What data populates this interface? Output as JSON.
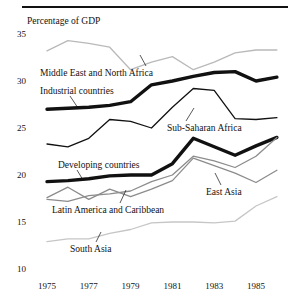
{
  "chart_data": {
    "type": "line",
    "title": "Percentage of GDP",
    "xlabel": "",
    "ylabel": "Percentage of GDP",
    "xlim": [
      1975,
      1986
    ],
    "ylim": [
      10,
      35
    ],
    "yticks": [
      35,
      30,
      25,
      20,
      15,
      10
    ],
    "xticks": [
      1975,
      1977,
      1979,
      1981,
      1983,
      1985
    ],
    "x": [
      1975,
      1976,
      1977,
      1978,
      1979,
      1980,
      1981,
      1982,
      1983,
      1984,
      1985,
      1986
    ],
    "grid": false,
    "legend": "inline-labels",
    "series": [
      {
        "name": "Middle East and North Africa",
        "color": "#b9b9b9",
        "width": 1.3,
        "label_x": 40,
        "label_y": 68,
        "leader": {
          "x1": 146,
          "y1": 66,
          "x2": 140,
          "y2": 55
        },
        "values": [
          33.2,
          34.3,
          34.0,
          33.6,
          31.2,
          32.0,
          32.6,
          31.2,
          32.0,
          33.0,
          33.3,
          33.3
        ]
      },
      {
        "name": "Industrial countries",
        "color": "#111111",
        "width": 3.4,
        "label_x": 40,
        "label_y": 86,
        "leader": {
          "x1": 70,
          "y1": 96,
          "x2": 78,
          "y2": 108
        },
        "values": [
          27.0,
          27.1,
          27.2,
          27.4,
          27.8,
          29.6,
          30.0,
          30.5,
          30.9,
          31.0,
          30.0,
          30.4
        ]
      },
      {
        "name": "Sub-Saharan Africa",
        "color": "#111111",
        "width": 1.3,
        "label_x": 167,
        "label_y": 123,
        "leader": {
          "x1": 186,
          "y1": 121,
          "x2": 194,
          "y2": 108
        },
        "values": [
          23.3,
          23.0,
          23.9,
          25.9,
          25.7,
          25.0,
          27.2,
          29.2,
          29.0,
          26.0,
          25.9,
          26.1
        ]
      },
      {
        "name": "Developing countries",
        "color": "#111111",
        "width": 3.4,
        "label_x": 58,
        "label_y": 160,
        "leader": {
          "x1": 77,
          "y1": 170,
          "x2": 83,
          "y2": 180
        },
        "values": [
          19.3,
          19.4,
          19.6,
          19.9,
          20.0,
          20.0,
          21.2,
          23.9,
          23.0,
          22.1,
          23.1,
          24.0
        ]
      },
      {
        "name": "Latin America and Caribbean",
        "color": "#8c8c8c",
        "width": 1.3,
        "label_x": 52,
        "label_y": 205,
        "leader": {
          "x1": 120,
          "y1": 203,
          "x2": 126,
          "y2": 190
        },
        "values": [
          17.6,
          18.7,
          17.4,
          18.5,
          17.7,
          18.5,
          19.4,
          21.8,
          21.0,
          20.2,
          19.2,
          20.5
        ]
      },
      {
        "name": "East Asia",
        "color": "#8c8c8c",
        "width": 1.3,
        "label_x": 206,
        "label_y": 187,
        "leader": {
          "x1": 221,
          "y1": 185,
          "x2": 215,
          "y2": 173
        },
        "values": [
          17.4,
          17.2,
          17.8,
          18.0,
          18.3,
          19.3,
          20.0,
          22.0,
          21.5,
          20.8,
          22.0,
          24.0
        ]
      },
      {
        "name": "South Asia",
        "color": "#c6c6c6",
        "width": 1.3,
        "label_x": 70,
        "label_y": 244,
        "leader": {
          "x1": 96,
          "y1": 242,
          "x2": 101,
          "y2": 232
        },
        "values": [
          12.9,
          13.2,
          13.2,
          13.8,
          14.2,
          14.9,
          15.0,
          15.0,
          14.9,
          15.1,
          16.7,
          17.7
        ]
      }
    ]
  }
}
